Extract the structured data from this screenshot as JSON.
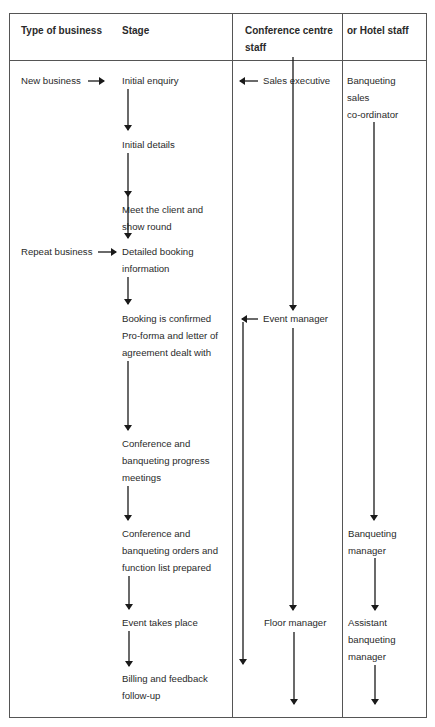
{
  "headers": {
    "type_of_business": "Type of business",
    "stage": "Stage",
    "conference_centre_staff_1": "Conference centre",
    "conference_centre_staff_2": "staff",
    "hotel_staff": "or Hotel staff"
  },
  "business_types": {
    "new": "New business",
    "repeat": "Repeat business"
  },
  "stages": [
    [
      "Initial enquiry"
    ],
    [
      "Initial details"
    ],
    [
      "Meet the client and",
      "show round"
    ],
    [
      "Detailed booking",
      "information"
    ],
    [
      "Booking is confirmed",
      "Pro-forma and letter of",
      "agreement dealt with"
    ],
    [
      "Conference and",
      "banqueting progress",
      "meetings"
    ],
    [
      "Conference and",
      "banqueting orders and",
      "function list prepared"
    ],
    [
      "Event takes place"
    ],
    [
      "Billing and feedback",
      "follow-up"
    ]
  ],
  "conference_staff": {
    "sales": "Sales executive",
    "event": "Event manager",
    "floor": "Floor manager"
  },
  "hotel_staff": {
    "coordinator": [
      "Banqueting",
      "sales",
      "co-ordinator"
    ],
    "manager": [
      "Banqueting",
      "manager"
    ],
    "assistant": [
      "Assistant",
      "banqueting",
      "manager"
    ]
  }
}
